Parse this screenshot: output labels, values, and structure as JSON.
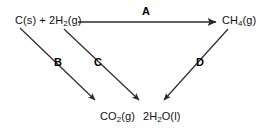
{
  "diagram": {
    "type": "reaction-cycle",
    "background_color": "#ffffff",
    "line_color": "#2b2b2b",
    "text_color": "#111111",
    "nodes": [
      {
        "id": "reactants",
        "label_html": "C(s) + 2H<sub>2</sub>(g)",
        "x": 15,
        "y": 21
      },
      {
        "id": "methane",
        "label_html": "CH<sub>4</sub>(g)",
        "x": 222,
        "y": 21
      },
      {
        "id": "co2",
        "label_html": "CO<sub>2</sub>(g)",
        "x": 100,
        "y": 117
      },
      {
        "id": "water",
        "label_html": "2H<sub>2</sub>O(l)",
        "x": 143,
        "y": 117
      }
    ],
    "arrows": [
      {
        "id": "A",
        "label": "A",
        "from": "reactants",
        "to": "methane",
        "x1": 78,
        "y1": 22,
        "x2": 216,
        "y2": 22
      },
      {
        "id": "B",
        "label": "B",
        "from": "reactants",
        "to": "co2",
        "x1": 20,
        "y1": 28,
        "x2": 95,
        "y2": 100
      },
      {
        "id": "C",
        "label": "C",
        "from": "reactants",
        "to": "water",
        "x1": 64,
        "y1": 29,
        "x2": 139,
        "y2": 100
      },
      {
        "id": "D",
        "label": "D",
        "from": "methane",
        "to": "water",
        "x1": 228,
        "y1": 29,
        "x2": 164,
        "y2": 100
      }
    ]
  },
  "labels": {
    "reactants": "C(s) + 2H2(g)",
    "methane": "CH4(g)",
    "co2": "CO2(g)",
    "water": "2H2O(l)",
    "arrow_a": "A",
    "arrow_b": "B",
    "arrow_c": "C",
    "arrow_d": "D"
  }
}
